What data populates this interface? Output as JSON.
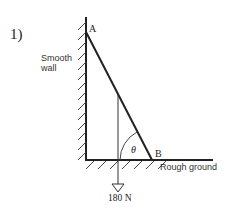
{
  "problem": {
    "number_label": "1)"
  },
  "labels": {
    "point_a": "A",
    "point_b": "B",
    "angle": "θ",
    "wall_line1": "Smooth",
    "wall_line2": "wall",
    "ground": "Rough ground",
    "weight": "180 N"
  },
  "colors": {
    "ink": "#222222",
    "background": "#ffffff"
  }
}
